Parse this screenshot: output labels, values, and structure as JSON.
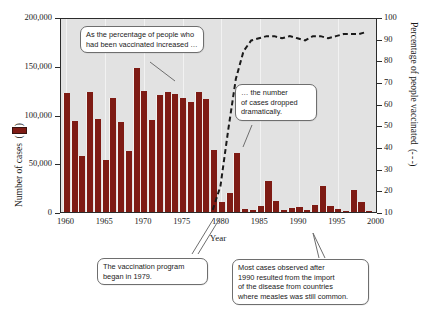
{
  "chart_data": {
    "type": "bar",
    "title": "",
    "subtitle": "",
    "xlabel": "Year",
    "ylabel": "Number of cases",
    "ylabel_right": "Percentage of people vaccinated",
    "ylabel_left_legend": "( ▮ )",
    "ylabel_right_legend": "( - - - )",
    "grid": "vertical light gridlines at 5-year intervals",
    "legend_position": "axis-titles",
    "xlim": [
      1959.3,
      2000.2
    ],
    "ylim": [
      0,
      200000
    ],
    "ylim_right": [
      10,
      100
    ],
    "xticks": [
      1960,
      1965,
      1970,
      1975,
      1980,
      1985,
      1990,
      1995,
      2000
    ],
    "xticklabels": [
      "1960",
      "1965",
      "1970",
      "1975",
      "1980",
      "1985",
      "1990",
      "1995",
      "2000"
    ],
    "yticks": [
      0,
      50000,
      100000,
      150000,
      200000
    ],
    "yticklabels": [
      "0",
      "50,000",
      "100,000",
      "150,000",
      "200,000"
    ],
    "yticks_right": [
      10,
      20,
      30,
      40,
      50,
      60,
      70,
      80,
      90,
      100
    ],
    "yticklabels_right": [
      "10",
      "20",
      "30",
      "40",
      "50",
      "60",
      "70",
      "80",
      "90",
      "100"
    ],
    "series": [
      {
        "name": "Number of cases",
        "type": "bar",
        "color": "#7e1b14",
        "axis": "left",
        "x": [
          1960,
          1961,
          1962,
          1963,
          1964,
          1965,
          1966,
          1967,
          1968,
          1969,
          1970,
          1971,
          1972,
          1973,
          1974,
          1975,
          1976,
          1977,
          1978,
          1979,
          1980,
          1981,
          1982,
          1983,
          1984,
          1985,
          1986,
          1987,
          1988,
          1989,
          1990,
          1991,
          1992,
          1993,
          1994,
          1995,
          1996,
          1997,
          1998,
          1999
        ],
        "values": [
          122000,
          93000,
          57000,
          123000,
          95000,
          53000,
          117000,
          92000,
          63000,
          148000,
          124000,
          94000,
          120000,
          123000,
          121000,
          117000,
          113000,
          123000,
          116000,
          64000,
          10000,
          20000,
          61000,
          3500,
          2000,
          6000,
          32000,
          11000,
          2500,
          4000,
          5000,
          2500,
          7000,
          27000,
          6500,
          3000,
          900,
          23000,
          10000,
          600
        ]
      },
      {
        "name": "Percentage of people vaccinated",
        "type": "line",
        "style": "dashed",
        "color": "#1a1a1a",
        "axis": "right",
        "x": [
          1979,
          1980,
          1981,
          1982,
          1983,
          1984,
          1985,
          1986,
          1987,
          1988,
          1989,
          1990,
          1991,
          1992,
          1993,
          1994,
          1995,
          1996,
          1997,
          1998,
          1999
        ],
        "values": [
          11,
          22,
          48,
          72,
          85,
          90,
          91,
          92,
          92,
          91,
          92,
          91,
          90,
          92,
          92,
          91,
          92,
          93,
          93,
          93,
          94
        ]
      }
    ],
    "annotations": [
      {
        "name": "vaccination-increase-callout",
        "lines": [
          "As the percentage of people who",
          "had been vaccinated increased …"
        ]
      },
      {
        "name": "cases-dropped-callout",
        "lines": [
          "… the number",
          "of cases dropped",
          "dramatically."
        ]
      },
      {
        "name": "program-began-callout",
        "lines": [
          "The vaccination program",
          "began in 1979."
        ]
      },
      {
        "name": "imported-cases-callout",
        "lines": [
          "Most cases observed after",
          "1990 resulted from the import",
          "of the disease from countries",
          "where measles was still common."
        ]
      }
    ],
    "colors": {
      "bar": "#7e1b14",
      "plot_background": "#e2e2e2",
      "axis": "#2b2b2b",
      "callout_border": "#6e6e6e",
      "page_background": "#ffffff"
    }
  },
  "axes": {
    "x_title": "Year",
    "y_left_title": "Number of cases",
    "y_right_title": "Percentage of people vaccinated",
    "x_ticks": [
      "1960",
      "1965",
      "1970",
      "1975",
      "1980",
      "1985",
      "1990",
      "1995",
      "2000"
    ],
    "y_left_ticks": [
      "200,000",
      "150,000",
      "100,000",
      "50,000",
      "0"
    ],
    "y_right_ticks": [
      "100",
      "90",
      "80",
      "70",
      "60",
      "50",
      "40",
      "30",
      "20",
      "10"
    ]
  },
  "callouts": {
    "top_left": {
      "line1": "As the percentage of people who",
      "line2": "had been vaccinated increased …"
    },
    "middle_right": {
      "line1": "… the number",
      "line2": "of cases dropped",
      "line3": "dramatically."
    },
    "bottom_left": {
      "line1": "The vaccination program",
      "line2": "began in 1979."
    },
    "bottom_right": {
      "line1": "Most cases observed after",
      "line2": "1990 resulted from the import",
      "line3": "of the disease from countries",
      "line4": "where measles was still common."
    }
  }
}
